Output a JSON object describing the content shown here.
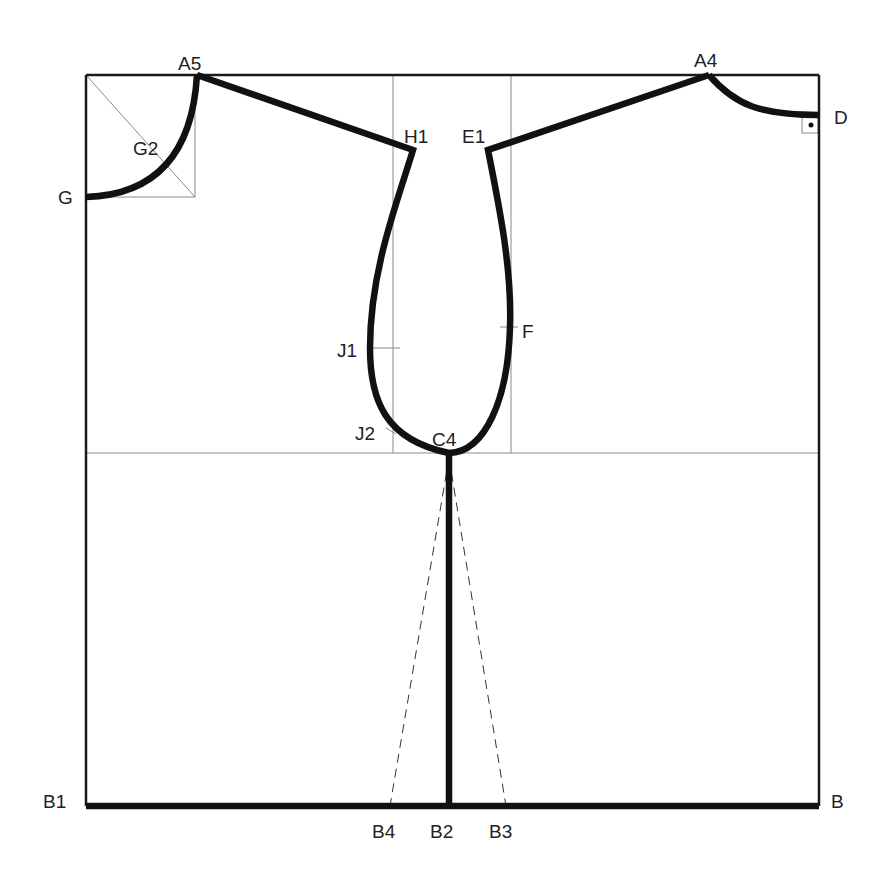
{
  "diagram": {
    "type": "sewing-pattern-draft",
    "colors": {
      "line": "#111111",
      "guide": "#8a8a8a",
      "background": "#ffffff"
    },
    "points": {
      "A5": "A5",
      "A4": "A4",
      "D": "D",
      "G": "G",
      "G2": "G2",
      "H1": "H1",
      "E1": "E1",
      "J1": "J1",
      "F": "F",
      "J2": "J2",
      "C4": "C4",
      "B1": "B1",
      "B": "B",
      "B4": "B4",
      "B2": "B2",
      "B3": "B3"
    }
  }
}
